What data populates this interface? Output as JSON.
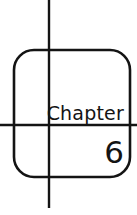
{
  "page": {
    "background_color": "#ffffff",
    "ink_color": "#141414",
    "width": 137,
    "height": 215
  },
  "card": {
    "name": "chapter-divider-card",
    "shape": "rounded-rectangle",
    "stroke_color": "#141414",
    "stroke_width": 2.6,
    "corner_radius": 20,
    "left": 14,
    "top": 50,
    "right": 130,
    "bottom": 177
  },
  "crosshair": {
    "vertical_line": {
      "name": "vertical-rule",
      "x": 49,
      "y_start": 0,
      "y_end": 208,
      "stroke_width": 2.4,
      "color": "#141414"
    },
    "horizontal_line": {
      "name": "horizontal-rule",
      "y": 125,
      "x_start": 0,
      "x_end": 137,
      "stroke_width": 2.4,
      "color": "#141414"
    }
  },
  "content": {
    "heading": "Chapter",
    "number": "6"
  }
}
